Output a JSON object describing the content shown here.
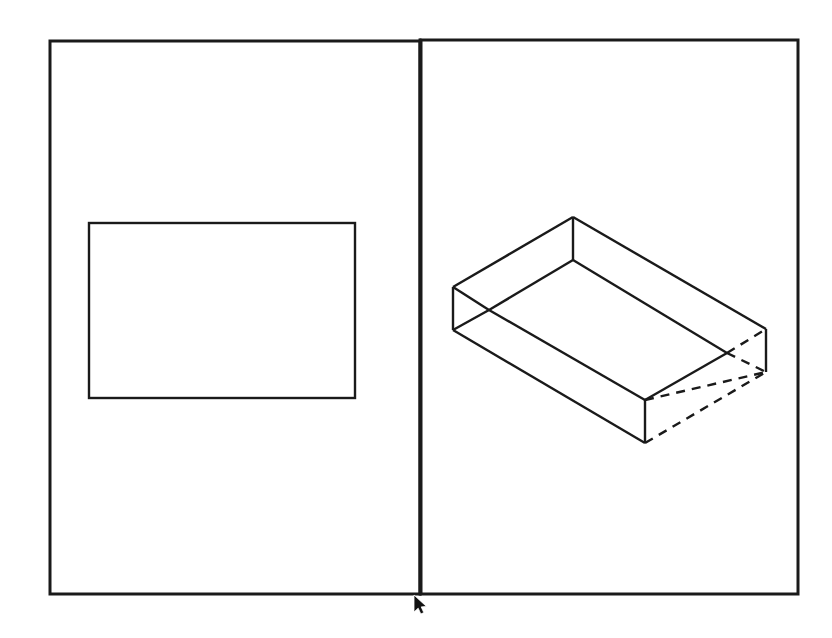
{
  "app": {
    "title": "CAD Viewport",
    "canvas_width": 832,
    "canvas_height": 638,
    "background_color": "#ffffff",
    "line_color": "#1a1a1a"
  },
  "panes": {
    "divider": {
      "name": "vertical-splitter",
      "x": 420,
      "y_top": 40,
      "y_bottom": 594,
      "stroke_width": 3
    },
    "left": {
      "label": "Plan View",
      "frame": {
        "x": 50,
        "y": 41,
        "width": 370,
        "height": 553
      },
      "shapes": [
        {
          "name": "plan-rectangle",
          "type": "rectangle",
          "x": 89,
          "y": 223,
          "width": 266,
          "height": 175,
          "stroke_width": 2.4,
          "style": "solid"
        }
      ]
    },
    "right": {
      "label": "3D Isometric View",
      "frame": {
        "x": 421,
        "y": 40,
        "width": 377,
        "height": 554
      },
      "shapes": [
        {
          "name": "open-box-solid-edges",
          "type": "polyline-set",
          "style": "solid",
          "stroke_width": 2.4,
          "paths": [
            "M 573 217 L 453 287",
            "M 573 217 L 766 329",
            "M 453 287 L 489 310",
            "M 453 287 L 453 330",
            "M 453 330 L 489 310",
            "M 573 217 L 573 260",
            "M 573 260 L 489 310",
            "M 573 260 L 727 353",
            "M 766 329 L 766 372",
            "M 453 330 L 645 443",
            "M 645 443 L 645 400",
            "M 489 310 L 645 400",
            "M 645 400 L 727 353"
          ]
        },
        {
          "name": "open-box-hidden-edges",
          "type": "polyline-set",
          "style": "dashed",
          "stroke_width": 2.4,
          "dash": "9 7",
          "paths": [
            "M 727 353 L 766 329",
            "M 727 353 L 766 372",
            "M 645 400 L 766 372",
            "M 645 443 L 766 372"
          ]
        }
      ]
    }
  },
  "cursor": {
    "name": "mouse-pointer",
    "x": 414,
    "y": 595,
    "color": "#111111"
  }
}
